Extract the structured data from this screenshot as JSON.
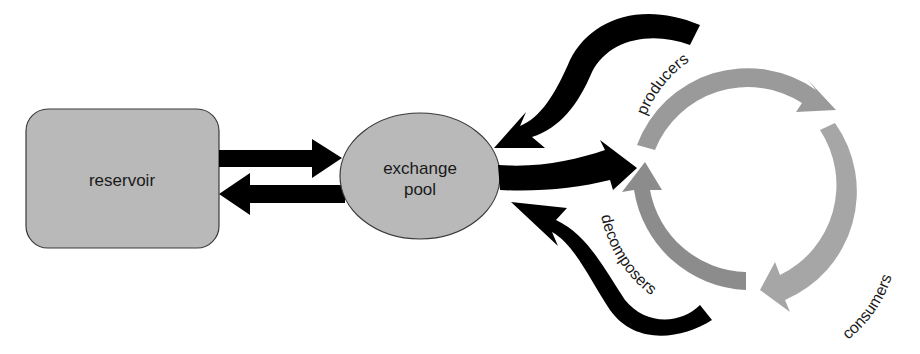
{
  "diagram": {
    "type": "biogeochemical cycle",
    "nodes": {
      "reservoir": {
        "label": "reservoir"
      },
      "exchange_pool": {
        "line1": "exchange",
        "line2": "pool"
      }
    },
    "cycle": {
      "producers": "producers",
      "consumers": "consumers",
      "decomposers": "decomposers"
    },
    "flows": [
      {
        "from": "reservoir",
        "to": "exchange pool"
      },
      {
        "from": "exchange pool",
        "to": "reservoir"
      },
      {
        "from": "exchange pool",
        "to": "producers"
      },
      {
        "from": "producers",
        "to": "exchange pool"
      },
      {
        "from": "decomposers",
        "to": "exchange pool"
      }
    ],
    "colors": {
      "node_fill": "#b9b9b9",
      "node_stroke": "#3a3a3a",
      "flow_arrow": "#000000",
      "producers_arc": "#9a9a9a",
      "consumers_arc": "#a6a6a6",
      "decomposers_arc": "#8c8c8c",
      "background": "#ffffff"
    }
  }
}
